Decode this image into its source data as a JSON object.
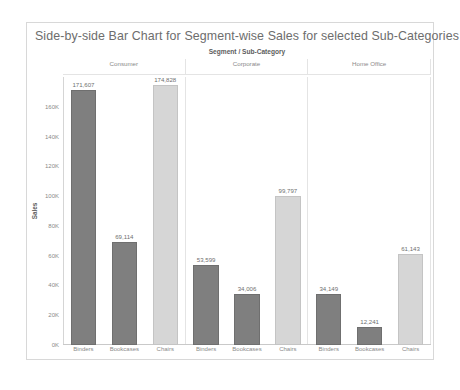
{
  "chart_title": "Side-by-side Bar Chart for Segment-wise Sales for selected Sub-Categories",
  "field_caption": "Segment / Sub-Category",
  "y_axis_title": "Sales",
  "segments": [
    {
      "label": "Consumer"
    },
    {
      "label": "Corporate"
    },
    {
      "label": "Home Office"
    }
  ],
  "y_ticks": [
    {
      "label": "160K",
      "value": 160000
    },
    {
      "label": "140K",
      "value": 140000
    },
    {
      "label": "120K",
      "value": 120000
    },
    {
      "label": "100K",
      "value": 100000
    },
    {
      "label": "80K",
      "value": 80000
    },
    {
      "label": "60K",
      "value": 60000
    },
    {
      "label": "40K",
      "value": 40000
    },
    {
      "label": "20K",
      "value": 20000
    },
    {
      "label": "0K",
      "value": 0
    }
  ],
  "bars": [
    {
      "segment": "Consumer",
      "category": "Binders",
      "value": 171607,
      "label": "171,607",
      "tone": "dark"
    },
    {
      "segment": "Consumer",
      "category": "Bookcases",
      "value": 69114,
      "label": "69,114",
      "tone": "dark"
    },
    {
      "segment": "Consumer",
      "category": "Chairs",
      "value": 174828,
      "label": "174,828",
      "tone": "light"
    },
    {
      "segment": "Corporate",
      "category": "Binders",
      "value": 53599,
      "label": "53,599",
      "tone": "dark"
    },
    {
      "segment": "Corporate",
      "category": "Bookcases",
      "value": 34006,
      "label": "34,006",
      "tone": "dark"
    },
    {
      "segment": "Corporate",
      "category": "Chairs",
      "value": 99797,
      "label": "99,797",
      "tone": "light"
    },
    {
      "segment": "Home Office",
      "category": "Binders",
      "value": 34149,
      "label": "34,149",
      "tone": "dark"
    },
    {
      "segment": "Home Office",
      "category": "Bookcases",
      "value": 12241,
      "label": "12,241",
      "tone": "dark"
    },
    {
      "segment": "Home Office",
      "category": "Chairs",
      "value": 61143,
      "label": "61,143",
      "tone": "light"
    }
  ],
  "chart_data": {
    "type": "bar",
    "title": "Side-by-side Bar Chart for Segment-wise Sales for selected Sub-Categories",
    "xlabel": "Segment / Sub-Category",
    "ylabel": "Sales",
    "ylim": [
      0,
      180000
    ],
    "ytick_labels": [
      "0K",
      "20K",
      "40K",
      "60K",
      "80K",
      "100K",
      "120K",
      "140K",
      "160K"
    ],
    "grid": false,
    "legend": "none",
    "panels": [
      "Consumer",
      "Corporate",
      "Home Office"
    ],
    "categories": [
      "Binders",
      "Bookcases",
      "Chairs"
    ],
    "series": [
      {
        "name": "Consumer",
        "values": [
          171607,
          69114,
          174828
        ]
      },
      {
        "name": "Corporate",
        "values": [
          53599,
          34006,
          99797
        ]
      },
      {
        "name": "Home Office",
        "values": [
          34149,
          12241,
          61143
        ]
      }
    ],
    "data_labels": [
      [
        "171,607",
        "69,114",
        "174,828"
      ],
      [
        "53,599",
        "34,006",
        "99,797"
      ],
      [
        "34,149",
        "12,241",
        "61,143"
      ]
    ],
    "colors": {
      "dark_bar": "#7f7f7f",
      "light_bar": "#d6d6d6",
      "text": "#6d6d6d",
      "frame": "#d8d8d8"
    }
  }
}
